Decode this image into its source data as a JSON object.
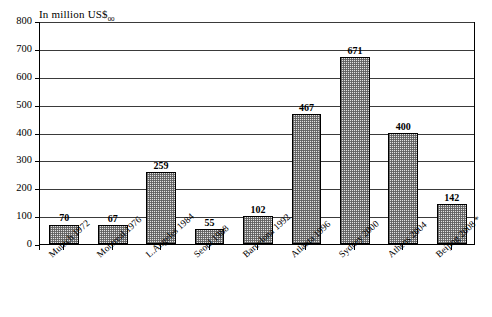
{
  "chart_data": {
    "type": "bar",
    "title": "In million US$",
    "title_subscript": "00",
    "xlabel": "",
    "ylabel": "",
    "ylim": [
      0,
      800
    ],
    "ytick_step": 100,
    "grid": true,
    "legend": false,
    "footnote_marker": "*",
    "categories": [
      "Munich 1972",
      "Montreal 1976",
      "L.Angeles 1984",
      "Seoul  1988",
      "Barcelona 1992",
      "Atlanta 1996",
      "Sydney 2000",
      "Athens 2004",
      "Beijing 2008 *"
    ],
    "values": [
      70,
      67,
      259,
      55,
      102,
      467,
      671,
      400,
      142
    ],
    "ytick_labels": [
      "0",
      "100",
      "200",
      "300",
      "400",
      "500",
      "600",
      "700",
      "800"
    ],
    "bar_style": {
      "fill": "#e2e2e2",
      "pattern": "fine-dot-stipple",
      "border": "#000000"
    }
  }
}
